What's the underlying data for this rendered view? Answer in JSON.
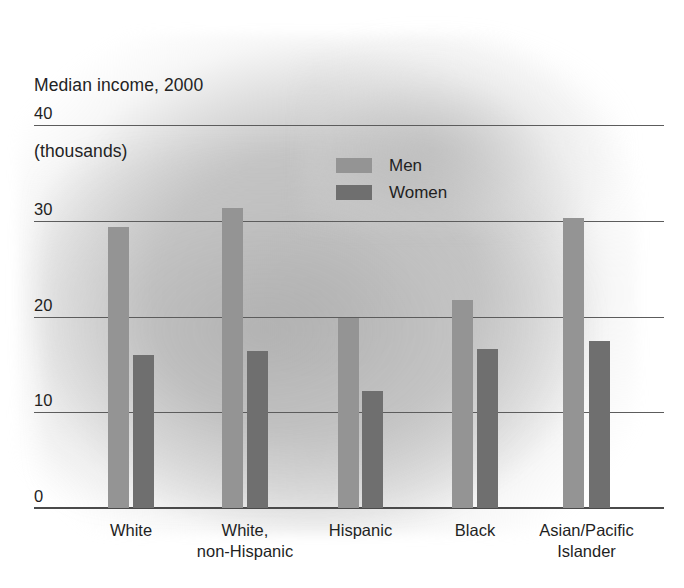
{
  "chart_data": {
    "type": "bar",
    "title": "Median income, 2000",
    "subtitle": "(thousands)",
    "xlabel": "",
    "ylabel": "",
    "ylim": [
      0,
      40
    ],
    "yticks": [
      0,
      10,
      20,
      30,
      40
    ],
    "ytick_labels": [
      "0",
      "10",
      "20",
      "30",
      "40"
    ],
    "grid": true,
    "legend_position": "upper center",
    "categories": [
      "White",
      "White,\nnon-Hispanic",
      "Hispanic",
      "Black",
      "Asian/Pacific\nIslander"
    ],
    "series": [
      {
        "name": "Men",
        "color": "#949494",
        "values": [
          29.3,
          31.3,
          19.8,
          21.7,
          30.3
        ]
      },
      {
        "name": "Women",
        "color": "#6f6f6f",
        "values": [
          16.0,
          16.4,
          12.2,
          16.6,
          17.4
        ]
      }
    ]
  },
  "legend": {
    "entries": [
      {
        "label": "Men",
        "swatch": "men"
      },
      {
        "label": "Women",
        "swatch": "women"
      }
    ]
  }
}
